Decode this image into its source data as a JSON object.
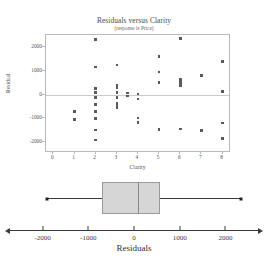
{
  "scatter": {
    "title": "Residuals versus Clarity",
    "subtitle": "(response is Price)",
    "xlabel": "Clarity",
    "ylabel": "Residual"
  },
  "boxplot": {
    "xlabel": "Residuals"
  },
  "chart_data": [
    {
      "type": "scatter",
      "title": "Residuals versus Clarity",
      "subtitle": "(response is Price)",
      "xlabel": "Clarity",
      "ylabel": "Residual",
      "xlim": [
        -0.35,
        8.4
      ],
      "ylim": [
        -2450,
        2500
      ],
      "xticks": [
        0,
        1,
        2,
        3,
        4,
        5,
        6,
        7,
        8
      ],
      "yticks": [
        -2000,
        -1000,
        0,
        1000,
        2000
      ],
      "grid": false,
      "legend": null,
      "reference_line": {
        "y": 0,
        "color": "#c9c9c9"
      },
      "marker": "square",
      "marker_color": "#5a5a5a",
      "points": [
        {
          "x": 1.0,
          "y": -700
        },
        {
          "x": 1.0,
          "y": -1050
        },
        {
          "x": 2.0,
          "y": 2300
        },
        {
          "x": 2.0,
          "y": 1150
        },
        {
          "x": 2.0,
          "y": 260
        },
        {
          "x": 2.0,
          "y": 90
        },
        {
          "x": 2.0,
          "y": -120
        },
        {
          "x": 2.0,
          "y": -420
        },
        {
          "x": 2.0,
          "y": -700
        },
        {
          "x": 2.0,
          "y": -1000
        },
        {
          "x": 2.0,
          "y": -1480
        },
        {
          "x": 2.0,
          "y": -1900
        },
        {
          "x": 3.0,
          "y": 1250
        },
        {
          "x": 3.0,
          "y": 400
        },
        {
          "x": 3.0,
          "y": 290
        },
        {
          "x": 3.0,
          "y": 80
        },
        {
          "x": 3.0,
          "y": -120
        },
        {
          "x": 3.0,
          "y": -380
        },
        {
          "x": 3.0,
          "y": -480
        },
        {
          "x": 3.0,
          "y": -560
        },
        {
          "x": 3.5,
          "y": 60
        },
        {
          "x": 3.5,
          "y": -60
        },
        {
          "x": 4.0,
          "y": 30
        },
        {
          "x": 4.0,
          "y": -190
        },
        {
          "x": 4.0,
          "y": -980
        },
        {
          "x": 4.0,
          "y": -1180
        },
        {
          "x": 5.0,
          "y": 1600
        },
        {
          "x": 5.0,
          "y": 940
        },
        {
          "x": 5.0,
          "y": 500
        },
        {
          "x": 5.0,
          "y": -1470
        },
        {
          "x": 6.0,
          "y": 2350
        },
        {
          "x": 6.0,
          "y": 640
        },
        {
          "x": 6.0,
          "y": 560
        },
        {
          "x": 6.0,
          "y": 470
        },
        {
          "x": 6.0,
          "y": 380
        },
        {
          "x": 6.0,
          "y": -1450
        },
        {
          "x": 7.0,
          "y": 790
        },
        {
          "x": 7.0,
          "y": -1500
        },
        {
          "x": 8.0,
          "y": 1400
        },
        {
          "x": 8.0,
          "y": 120
        },
        {
          "x": 8.0,
          "y": -1200
        },
        {
          "x": 8.0,
          "y": -1850
        }
      ]
    },
    {
      "type": "boxplot",
      "xlabel": "Residuals",
      "xlim": [
        -2450,
        2450
      ],
      "xticks": [
        -2000,
        -1000,
        0,
        1000,
        2000
      ],
      "xtick_labels": [
        "-2000",
        "-1000",
        "0",
        "1000",
        "2000"
      ],
      "orientation": "horizontal",
      "box_fill": "#d6d6d6",
      "stats": {
        "whisker_low": -1900,
        "q1": -700,
        "median": 90,
        "q3": 560,
        "whisker_high": 2350
      }
    }
  ]
}
